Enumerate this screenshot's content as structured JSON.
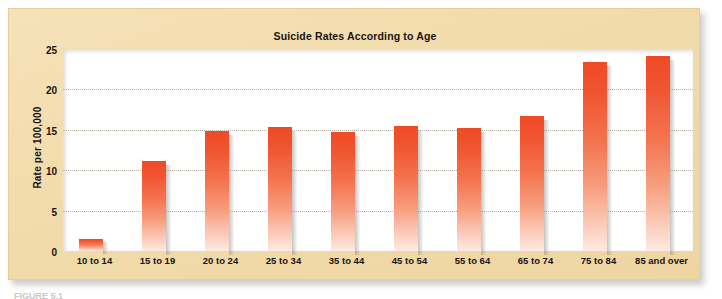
{
  "chart_data": {
    "type": "bar",
    "title": "Suicide Rates According to Age",
    "xlabel": "",
    "ylabel": "Rate per 100,000",
    "categories": [
      "10 to 14",
      "15 to 19",
      "20 to 24",
      "25 to 34",
      "35 to 44",
      "45 to 54",
      "55 to 64",
      "65 to 74",
      "75 to 84",
      "85 and over"
    ],
    "values": [
      1.5,
      11.1,
      14.8,
      15.3,
      14.7,
      15.5,
      15.2,
      16.7,
      23.4,
      24.1
    ],
    "ylim": [
      0,
      25
    ],
    "yticks": [
      0,
      5,
      10,
      15,
      20,
      25
    ],
    "ytick_labels": [
      "0",
      "5",
      "10",
      "15",
      "20",
      "25"
    ],
    "grid": true,
    "legend": "none",
    "bar_color_top": "#EF4A26",
    "bar_color_bottom": "#FDEAE2",
    "panel_background": "#F2DBAB",
    "plot_background": "#FFFFFF"
  },
  "caption": {
    "text": "FIGURE 5.1"
  }
}
